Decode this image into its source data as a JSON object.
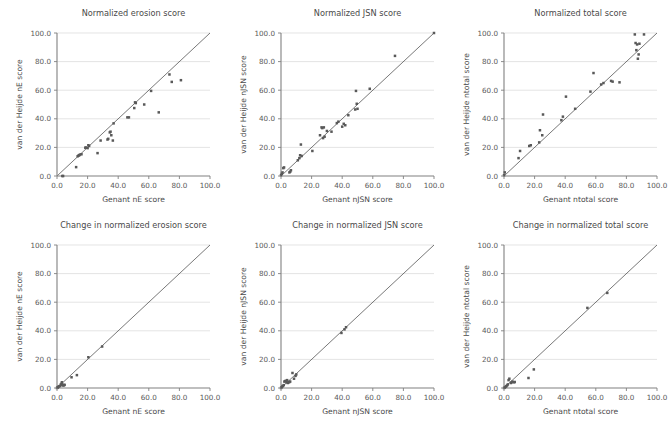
{
  "figure": {
    "panel_count": 6,
    "rows": 2,
    "cols": 3
  },
  "axis": {
    "ticks": [
      "0.0",
      "20.0",
      "40.0",
      "60.0",
      "80.0",
      "100.0"
    ],
    "tickvals": [
      0,
      20,
      40,
      60,
      80,
      100
    ],
    "min": 0,
    "max": 100
  },
  "chart_data": [
    {
      "type": "scatter",
      "title": "Normalized erosion score",
      "xlabel": "Genant nE score",
      "ylabel": "van der Heijde nE score",
      "xlim": [
        0,
        100
      ],
      "ylim": [
        0,
        100
      ],
      "grid": true,
      "reference_line": "identity",
      "x": [
        3.5,
        4.0,
        12.5,
        13.5,
        14.0,
        14.5,
        15.0,
        16.0,
        18.5,
        19.0,
        20.0,
        20.5,
        21.0,
        26.5,
        28.5,
        33.0,
        33.5,
        34.5,
        35.0,
        35.5,
        36.5,
        37.0,
        46.0,
        47.0,
        50.5,
        51.0,
        51.5,
        57.0,
        61.5,
        66.5,
        73.5,
        75.0,
        81.0
      ],
      "y": [
        0.0,
        0.0,
        6.2,
        13.8,
        14.2,
        14.5,
        15.0,
        15.2,
        19.8,
        19.9,
        19.5,
        21.5,
        21.0,
        16.0,
        24.8,
        25.5,
        26.0,
        30.5,
        31.0,
        28.5,
        24.8,
        36.8,
        41.0,
        41.0,
        47.5,
        51.5,
        51.0,
        50.0,
        59.5,
        44.5,
        71.0,
        65.8,
        67.0
      ]
    },
    {
      "type": "scatter",
      "title": "Normalized JSN score",
      "xlabel": "Genant nJSN score",
      "ylabel": "van der Heijde nJSN score",
      "xlim": [
        0,
        100
      ],
      "ylim": [
        0,
        100
      ],
      "grid": true,
      "reference_line": "identity",
      "x": [
        0.0,
        0.5,
        1.0,
        1.5,
        2.0,
        5.5,
        6.0,
        6.5,
        11.0,
        12.0,
        12.5,
        13.0,
        13.5,
        20.5,
        25.5,
        26.5,
        27.0,
        27.5,
        28.0,
        28.5,
        30.0,
        33.0,
        36.5,
        37.5,
        40.0,
        41.0,
        42.0,
        44.0,
        48.5,
        49.0,
        49.5,
        50.0,
        58.0,
        74.5,
        100.0
      ],
      "y": [
        0.5,
        1.5,
        2.5,
        5.5,
        6.0,
        2.5,
        3.0,
        4.0,
        11.0,
        12.5,
        14.5,
        22.0,
        14.0,
        17.5,
        28.5,
        34.0,
        33.5,
        26.5,
        34.0,
        27.5,
        31.5,
        31.0,
        37.0,
        38.0,
        34.5,
        36.5,
        35.5,
        42.5,
        46.5,
        59.5,
        50.5,
        47.0,
        61.0,
        84.0,
        100.0
      ]
    },
    {
      "type": "scatter",
      "title": "Normalized total score",
      "xlabel": "Genant ntotal score",
      "ylabel": "van der Heijde ntotal score",
      "xlim": [
        0,
        100
      ],
      "ylim": [
        0,
        100
      ],
      "grid": true,
      "reference_line": "identity",
      "x": [
        0.0,
        0.5,
        9.5,
        10.5,
        16.5,
        17.5,
        23.0,
        23.5,
        25.5,
        25.0,
        37.5,
        38.5,
        40.5,
        46.5,
        56.5,
        58.5,
        63.5,
        65.0,
        70.0,
        71.0,
        75.5,
        85.5,
        86.0,
        86.5,
        87.0,
        87.5,
        88.0,
        88.5,
        91.5
      ],
      "y": [
        0.5,
        2.5,
        12.5,
        17.5,
        21.0,
        21.5,
        23.5,
        32.0,
        43.0,
        28.5,
        39.0,
        41.5,
        55.5,
        47.0,
        59.0,
        72.0,
        64.0,
        65.0,
        66.5,
        66.0,
        65.5,
        99.0,
        93.0,
        88.0,
        92.0,
        82.0,
        85.0,
        92.5,
        99.0
      ]
    },
    {
      "type": "scatter",
      "title": "Change in normalized erosion score",
      "xlabel": "Genant nE score",
      "ylabel": "van der Heijde nE score",
      "xlim": [
        0,
        100
      ],
      "ylim": [
        0,
        100
      ],
      "grid": true,
      "reference_line": "identity",
      "x": [
        0.0,
        0.3,
        0.6,
        1.0,
        1.5,
        2.0,
        2.5,
        3.0,
        3.2,
        3.5,
        4.0,
        4.2,
        4.5,
        5.0,
        9.5,
        13.0,
        20.5,
        29.5
      ],
      "y": [
        0.0,
        0.2,
        0.5,
        1.0,
        1.2,
        1.5,
        2.5,
        3.0,
        4.0,
        2.0,
        2.2,
        1.8,
        2.0,
        2.2,
        7.5,
        9.0,
        21.5,
        29.0
      ]
    },
    {
      "type": "scatter",
      "title": "Change in normalized JSN score",
      "xlabel": "Genant nJSN score",
      "ylabel": "van der Heijde nJSN score",
      "xlim": [
        0,
        100
      ],
      "ylim": [
        0,
        100
      ],
      "grid": true,
      "reference_line": "identity",
      "x": [
        0.0,
        0.4,
        0.8,
        1.2,
        1.8,
        2.2,
        2.8,
        3.2,
        3.6,
        4.0,
        4.4,
        5.0,
        5.5,
        6.0,
        7.5,
        8.5,
        9.5,
        10.0,
        39.5,
        41.5,
        42.5
      ],
      "y": [
        0.0,
        0.5,
        1.0,
        1.5,
        2.0,
        4.5,
        4.8,
        5.0,
        4.0,
        5.5,
        3.5,
        4.0,
        4.2,
        4.5,
        10.5,
        6.5,
        8.5,
        9.5,
        38.5,
        41.0,
        42.5
      ]
    },
    {
      "type": "scatter",
      "title": "Change in normalized total score",
      "xlabel": "Genant ntotal score",
      "ylabel": "van der Heijde ntotal score",
      "xlim": [
        0,
        100
      ],
      "ylim": [
        0,
        100
      ],
      "grid": true,
      "reference_line": "identity",
      "x": [
        0.0,
        0.5,
        1.0,
        1.5,
        2.0,
        2.5,
        3.0,
        3.5,
        4.5,
        5.0,
        5.5,
        6.5,
        7.0,
        16.0,
        19.5,
        54.5,
        67.5
      ],
      "y": [
        0.0,
        0.3,
        0.8,
        1.2,
        1.8,
        2.5,
        5.5,
        6.5,
        3.5,
        4.0,
        4.5,
        4.0,
        4.2,
        7.0,
        13.0,
        56.0,
        66.5
      ]
    }
  ]
}
